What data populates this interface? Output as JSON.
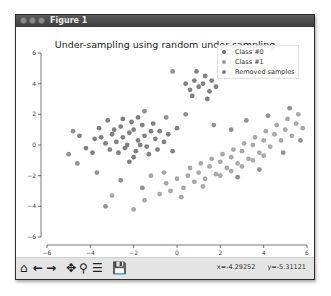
{
  "window": {
    "title": "Figure 1"
  },
  "toolbar": {
    "icons": [
      "home-icon",
      "back-icon",
      "forward-icon",
      "pan-icon",
      "zoom-icon",
      "configure-subplots-icon",
      "save-icon"
    ],
    "x_readout": "x=-4.29252",
    "y_readout": "y=-5.31121"
  },
  "colors": {
    "class0": "#6b6b6b",
    "class1": "#9a9a9a",
    "removed": "#7f7f7f",
    "titlebar": "#4a4a4a"
  },
  "chart_data": {
    "type": "scatter",
    "title": "Under-sampling using random under-sampling",
    "xlabel": "",
    "ylabel": "",
    "xlim": [
      -6,
      6
    ],
    "ylim": [
      -6,
      6
    ],
    "xticks": [
      "-6",
      "-4",
      "-2",
      "0",
      "2",
      "4",
      "6"
    ],
    "yticks": [
      "6",
      "4",
      "2",
      "0",
      "-2",
      "-4",
      "-6"
    ],
    "grid": false,
    "legend_position": "upper right",
    "legend": [
      "Class #0",
      "Class #1",
      "Removed samples"
    ],
    "series": [
      {
        "name": "Class #0",
        "description": "dense blob centered near (-2, 0.5), plus a small cluster near (1, 4)",
        "points": [
          [
            -2.5,
            0.5
          ],
          [
            -2.2,
            0.8
          ],
          [
            -1.8,
            0.3
          ],
          [
            -2.0,
            1.0
          ],
          [
            -1.5,
            0.6
          ],
          [
            -2.8,
            0.2
          ],
          [
            -3.0,
            0.7
          ],
          [
            -1.2,
            0.9
          ],
          [
            -2.4,
            -0.2
          ],
          [
            -1.9,
            -0.4
          ],
          [
            -2.6,
            1.2
          ],
          [
            -1.6,
            1.3
          ],
          [
            -3.3,
            0.1
          ],
          [
            -3.5,
            0.5
          ],
          [
            -1.0,
            0.4
          ],
          [
            -0.8,
            0.9
          ],
          [
            -2.1,
            1.5
          ],
          [
            -2.7,
            -0.5
          ],
          [
            -1.4,
            -0.1
          ],
          [
            -3.1,
            -0.3
          ],
          [
            -2.3,
            0.0
          ],
          [
            -1.7,
            0.0
          ],
          [
            -2.9,
            1.0
          ],
          [
            -0.6,
            0.2
          ],
          [
            -1.1,
            1.4
          ],
          [
            -3.8,
            0.4
          ],
          [
            -4.2,
            -0.2
          ],
          [
            -3.6,
            1.1
          ],
          [
            -2.0,
            -0.8
          ],
          [
            -1.3,
            -0.6
          ],
          [
            -0.4,
            0.7
          ],
          [
            -2.5,
            1.7
          ],
          [
            -1.8,
            1.8
          ],
          [
            -4.5,
            0.6
          ],
          [
            -3.9,
            -0.5
          ],
          [
            -0.9,
            -0.3
          ],
          [
            0.0,
            1.1
          ],
          [
            -0.2,
            -0.4
          ],
          [
            -2.2,
            -1.1
          ],
          [
            -3.2,
            1.6
          ],
          [
            0.8,
            4.2
          ],
          [
            1.0,
            3.8
          ],
          [
            1.3,
            4.5
          ],
          [
            0.6,
            3.6
          ],
          [
            1.5,
            3.5
          ],
          [
            1.2,
            4.0
          ],
          [
            0.9,
            4.8
          ],
          [
            1.6,
            4.2
          ],
          [
            0.7,
            3.2
          ],
          [
            1.4,
            3.0
          ],
          [
            0.4,
            4.0
          ],
          [
            1.8,
            3.8
          ]
        ]
      },
      {
        "name": "Class #1",
        "description": "diagonal band from about (-1,-3) to (6,2)",
        "points": [
          [
            -0.5,
            -2.5
          ],
          [
            0.0,
            -2.2
          ],
          [
            0.5,
            -2.0
          ],
          [
            1.0,
            -1.8
          ],
          [
            1.5,
            -1.4
          ],
          [
            2.0,
            -1.1
          ],
          [
            2.5,
            -0.8
          ],
          [
            3.0,
            -0.4
          ],
          [
            3.5,
            0.0
          ],
          [
            4.0,
            0.3
          ],
          [
            4.5,
            0.7
          ],
          [
            5.0,
            1.0
          ],
          [
            5.5,
            1.4
          ],
          [
            0.3,
            -2.8
          ],
          [
            0.8,
            -2.4
          ],
          [
            1.3,
            -2.2
          ],
          [
            1.8,
            -1.9
          ],
          [
            2.3,
            -1.5
          ],
          [
            2.8,
            -1.2
          ],
          [
            3.3,
            -0.9
          ],
          [
            3.8,
            -0.5
          ],
          [
            4.3,
            -0.1
          ],
          [
            4.8,
            0.3
          ],
          [
            5.3,
            0.6
          ],
          [
            5.8,
            1.1
          ],
          [
            -0.8,
            -3.2
          ],
          [
            -0.3,
            -3.0
          ],
          [
            0.6,
            -1.5
          ],
          [
            1.1,
            -1.2
          ],
          [
            1.6,
            -0.9
          ],
          [
            2.1,
            -0.6
          ],
          [
            2.6,
            -0.3
          ],
          [
            3.1,
            0.1
          ],
          [
            3.6,
            0.5
          ],
          [
            4.1,
            0.9
          ],
          [
            4.6,
            1.3
          ],
          [
            5.1,
            1.7
          ],
          [
            5.6,
            2.0
          ],
          [
            -1.2,
            -2.0
          ],
          [
            -0.6,
            -1.8
          ],
          [
            2.0,
            -2.0
          ],
          [
            2.5,
            -1.7
          ],
          [
            3.0,
            -1.4
          ],
          [
            3.5,
            -1.0
          ],
          [
            4.0,
            -0.7
          ],
          [
            1.2,
            -2.7
          ],
          [
            0.2,
            -3.4
          ],
          [
            -1.5,
            -3.6
          ],
          [
            -2.0,
            -4.2
          ],
          [
            -3.0,
            -3.3
          ]
        ]
      },
      {
        "name": "Removed samples",
        "description": "scattered samples from majority class overlapping both clusters",
        "points": [
          [
            -4.8,
            0.9
          ],
          [
            -5.0,
            -0.6
          ],
          [
            -4.6,
            -1.2
          ],
          [
            -3.7,
            -1.8
          ],
          [
            -2.6,
            -2.3
          ],
          [
            -1.5,
            2.2
          ],
          [
            -0.5,
            1.8
          ],
          [
            0.4,
            2.0
          ],
          [
            1.7,
            1.3
          ],
          [
            2.5,
            1.0
          ],
          [
            3.2,
            1.6
          ],
          [
            4.2,
            1.9
          ],
          [
            5.2,
            2.4
          ],
          [
            5.7,
            0.3
          ],
          [
            4.9,
            -0.5
          ],
          [
            3.8,
            -1.6
          ],
          [
            2.8,
            -2.1
          ],
          [
            -0.2,
            4.8
          ],
          [
            -1.6,
            -2.8
          ],
          [
            -3.3,
            -4.0
          ]
        ]
      }
    ]
  }
}
